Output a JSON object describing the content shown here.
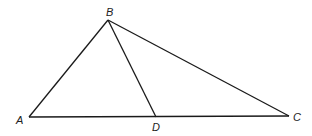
{
  "figure": {
    "type": "triangle",
    "points": {
      "A": {
        "label": "A",
        "x": 29,
        "y": 117
      },
      "B": {
        "label": "B",
        "x": 108,
        "y": 20
      },
      "C": {
        "label": "C",
        "x": 289,
        "y": 116
      },
      "D": {
        "label": "D",
        "x": 156,
        "y": 117
      }
    },
    "segments": [
      "AB",
      "BC",
      "AC",
      "BD"
    ],
    "stroke_color": "#1a1a1a"
  }
}
